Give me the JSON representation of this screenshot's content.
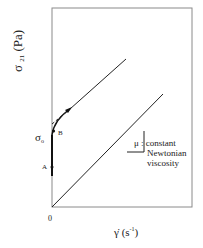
{
  "diagram": {
    "type": "flow-curve",
    "y_axis": {
      "symbol": "σ",
      "subscript": "21",
      "unit": "(Pa)"
    },
    "x_axis": {
      "symbol": "γ̇",
      "unit_prefix": "(s",
      "unit_exp": "-1",
      "unit_suffix": ")"
    },
    "origin_label": "0",
    "points": {
      "sigma0": {
        "symbol": "σ",
        "subscript": "o"
      },
      "A": "A",
      "B": "B"
    },
    "annotation": {
      "symbol": "μ",
      "separator": ":",
      "lines": [
        "constant",
        "Newtonian",
        "viscosity"
      ]
    },
    "lines": [
      {
        "name": "bingham-line",
        "from": [
          52,
          135
        ],
        "to": [
          126,
          59
        ]
      },
      {
        "name": "newtonian-line",
        "from": [
          52,
          207
        ],
        "to": [
          163,
          94
        ]
      }
    ],
    "colors": {
      "stroke": "#222222",
      "frame": "#777777"
    }
  }
}
